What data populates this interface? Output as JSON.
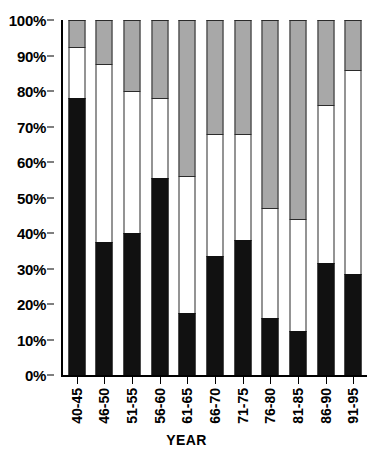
{
  "chart_data": {
    "type": "bar",
    "stacked": true,
    "title": "",
    "subtitle": "",
    "xlabel": "YEAR",
    "ylabel": "",
    "categories": [
      "40-45",
      "46-50",
      "51-55",
      "56-60",
      "61-65",
      "66-70",
      "71-75",
      "76-80",
      "81-85",
      "86-90",
      "91-95"
    ],
    "ylim": [
      0,
      100
    ],
    "ytick_labels": [
      "0%",
      "10%",
      "20%",
      "30%",
      "40%",
      "50%",
      "60%",
      "70%",
      "80%",
      "90%",
      "100%"
    ],
    "ytick_values": [
      0,
      10,
      20,
      30,
      40,
      50,
      60,
      70,
      80,
      90,
      100
    ],
    "grid": false,
    "legend": null,
    "series": [
      {
        "name": "black",
        "color": "#111111",
        "values": [
          78,
          37.5,
          40,
          55.5,
          17.5,
          33.5,
          38,
          16,
          12.5,
          31.5,
          28.5
        ]
      },
      {
        "name": "white",
        "color": "#ffffff",
        "values": [
          14.5,
          50,
          40,
          22.5,
          38.5,
          34.5,
          30,
          31,
          31.5,
          44.5,
          57.5
        ]
      },
      {
        "name": "gray",
        "color": "#a8a8a8",
        "values": [
          7.5,
          12.5,
          20,
          22,
          44,
          32,
          32,
          53,
          56,
          24,
          14
        ]
      }
    ],
    "cumulative_tops": {
      "black": [
        78,
        37.5,
        40,
        55.5,
        17.5,
        33.5,
        38,
        16,
        12.5,
        31.5,
        28.5
      ],
      "white": [
        92.5,
        87.5,
        80,
        78,
        56,
        68,
        68,
        47,
        44,
        76,
        86
      ],
      "gray": [
        100,
        100,
        100,
        100,
        100,
        100,
        100,
        100,
        100,
        100,
        100
      ]
    }
  }
}
